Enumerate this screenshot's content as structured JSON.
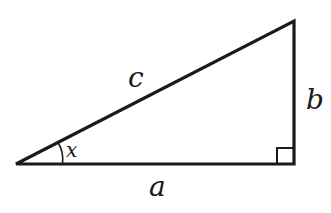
{
  "diagram": {
    "type": "right-triangle",
    "labels": {
      "hypotenuse": "c",
      "vertical_leg": "b",
      "horizontal_leg": "a",
      "angle": "x"
    },
    "colors": {
      "stroke": "#1a1a1a",
      "background": "#ffffff"
    }
  }
}
